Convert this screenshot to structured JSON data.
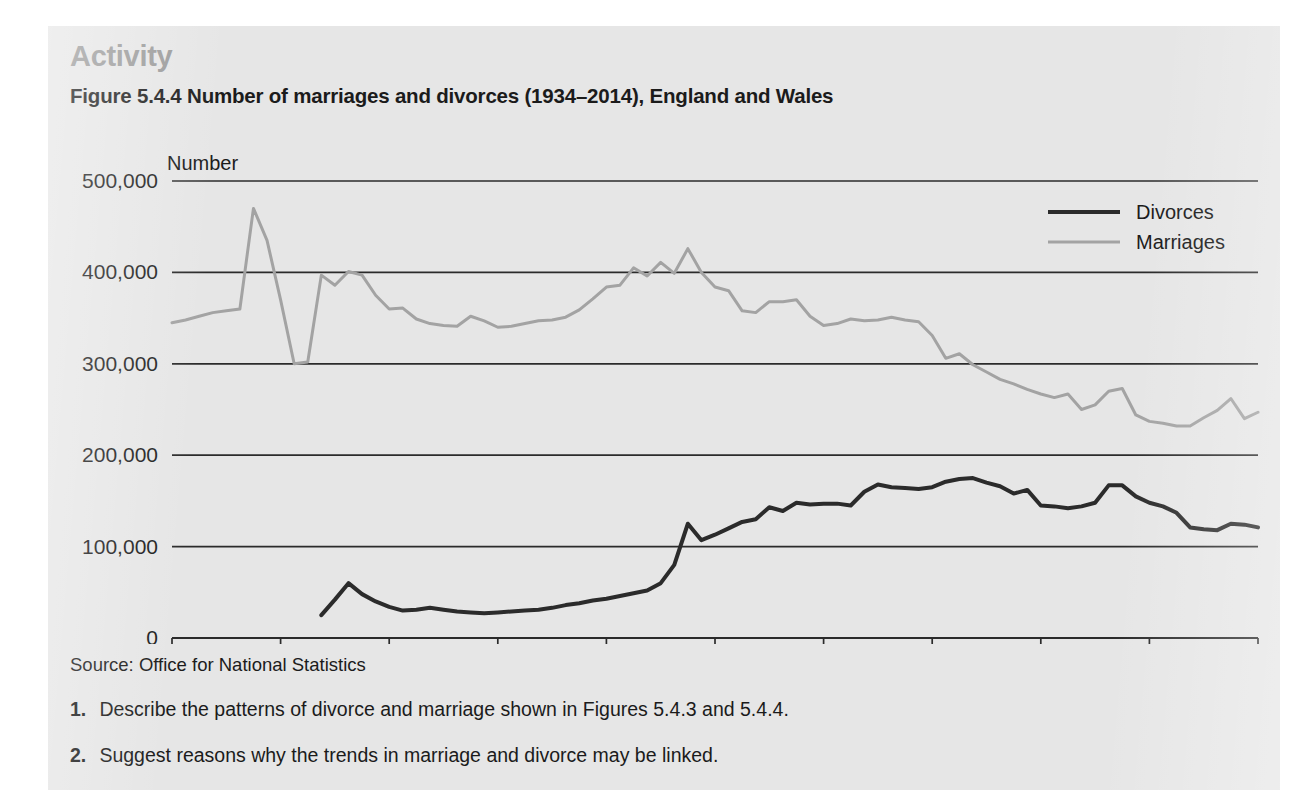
{
  "panel": {
    "activity_heading": "Activity",
    "figure_title": "Figure 5.4.4 Number of marriages and divorces (1934–2014), England and Wales",
    "source": "Source: Office for National Statistics",
    "questions": [
      {
        "num": "1.",
        "text": "Describe the patterns of divorce and marriage shown in Figures 5.4.3 and 5.4.4."
      },
      {
        "num": "2.",
        "text": "Suggest reasons why the trends in marriage and divorce may be linked."
      }
    ]
  },
  "colors": {
    "panel_background": "#e6e6e6",
    "page_background": "#ffffff",
    "heading_gray": "#9a9a9a",
    "text_black": "#1b1b1b",
    "divorces_line": "#2b2b2b",
    "marriages_line": "#a3a3a3",
    "gridline": "#2b2b2b"
  },
  "chart_data": {
    "type": "line",
    "title": "Figure 5.4.4 Number of marriages and divorces (1934–2014), England and Wales",
    "subtitle": "",
    "xlabel": "",
    "ylabel": "Number",
    "ylim": [
      0,
      500000
    ],
    "xlim": [
      1934,
      2014
    ],
    "yticks": [
      0,
      100000,
      200000,
      300000,
      400000,
      500000
    ],
    "ytick_labels": [
      "0",
      "100,000",
      "200,000",
      "300,000",
      "400,000",
      "500,000"
    ],
    "xticks": [
      1934,
      1942,
      1950,
      1958,
      1966,
      1974,
      1982,
      1990,
      1998,
      2006,
      2014
    ],
    "xtick_labels": [
      "1934",
      "1942",
      "1950",
      "1958",
      "1966",
      "1974",
      "1982",
      "1990",
      "1998",
      "2006",
      "2014"
    ],
    "grid": true,
    "grid_axis": "y",
    "legend": [
      "Divorces",
      "Marriages"
    ],
    "legend_position": "top-right",
    "series": [
      {
        "name": "Marriages",
        "color": "#a3a3a3",
        "x": [
          1934,
          1935,
          1936,
          1937,
          1938,
          1939,
          1940,
          1941,
          1942,
          1943,
          1944,
          1945,
          1946,
          1947,
          1948,
          1949,
          1950,
          1951,
          1952,
          1953,
          1954,
          1955,
          1956,
          1957,
          1958,
          1959,
          1960,
          1961,
          1962,
          1963,
          1964,
          1965,
          1966,
          1967,
          1968,
          1969,
          1970,
          1971,
          1972,
          1973,
          1974,
          1975,
          1976,
          1977,
          1978,
          1979,
          1980,
          1981,
          1982,
          1983,
          1984,
          1985,
          1986,
          1987,
          1988,
          1989,
          1990,
          1991,
          1992,
          1993,
          1994,
          1995,
          1996,
          1997,
          1998,
          1999,
          2000,
          2001,
          2002,
          2003,
          2004,
          2005,
          2006,
          2007,
          2008,
          2009,
          2010,
          2011,
          2012,
          2013,
          2014
        ],
        "values": [
          345000,
          348000,
          352000,
          356000,
          358000,
          360000,
          470000,
          435000,
          370000,
          300000,
          302000,
          397000,
          386000,
          401000,
          397000,
          375000,
          360000,
          361000,
          349000,
          344000,
          342000,
          341000,
          352000,
          347000,
          340000,
          341000,
          344000,
          347000,
          348000,
          351000,
          359000,
          371000,
          384000,
          386000,
          405000,
          396000,
          411000,
          399000,
          426000,
          400000,
          384000,
          380000,
          358000,
          356000,
          368000,
          368000,
          370000,
          352000,
          342000,
          344000,
          349000,
          347000,
          348000,
          351000,
          348000,
          346000,
          331000,
          306000,
          311000,
          299000,
          291000,
          283000,
          278000,
          272000,
          267000,
          263000,
          267000,
          250000,
          255000,
          270000,
          273000,
          244000,
          237000,
          235000,
          232000,
          232000,
          241000,
          249000,
          262000,
          240000,
          247000
        ]
      },
      {
        "name": "Divorces",
        "color": "#2b2b2b",
        "x": [
          1945,
          1946,
          1947,
          1948,
          1949,
          1950,
          1951,
          1952,
          1953,
          1954,
          1955,
          1956,
          1957,
          1958,
          1959,
          1960,
          1961,
          1962,
          1963,
          1964,
          1965,
          1966,
          1967,
          1968,
          1969,
          1970,
          1971,
          1972,
          1973,
          1974,
          1975,
          1976,
          1977,
          1978,
          1979,
          1980,
          1981,
          1982,
          1983,
          1984,
          1985,
          1986,
          1987,
          1988,
          1989,
          1990,
          1991,
          1992,
          1993,
          1994,
          1995,
          1996,
          1997,
          1998,
          1999,
          2000,
          2001,
          2002,
          2003,
          2004,
          2005,
          2006,
          2007,
          2008,
          2009,
          2010,
          2011,
          2012,
          2013,
          2014
        ],
        "values": [
          25000,
          42000,
          60000,
          48000,
          40000,
          34000,
          30000,
          31000,
          33000,
          31000,
          29000,
          28000,
          27000,
          28000,
          29000,
          30000,
          31000,
          33000,
          36000,
          38000,
          41000,
          43000,
          46000,
          49000,
          52000,
          60000,
          80000,
          125000,
          107000,
          113000,
          120000,
          127000,
          130000,
          143000,
          139000,
          148000,
          146000,
          147000,
          147000,
          145000,
          160000,
          168000,
          165000,
          164000,
          163000,
          165000,
          171000,
          174000,
          175000,
          170000,
          166000,
          158000,
          162000,
          145000,
          144000,
          142000,
          144000,
          148000,
          167000,
          167000,
          155000,
          148000,
          144000,
          137000,
          121000,
          119000,
          118000,
          125000,
          124000,
          121000
        ]
      }
    ],
    "annotations": [
      {
        "text": "Number",
        "type": "axis-unit-label",
        "position": "above-top-left"
      }
    ]
  }
}
